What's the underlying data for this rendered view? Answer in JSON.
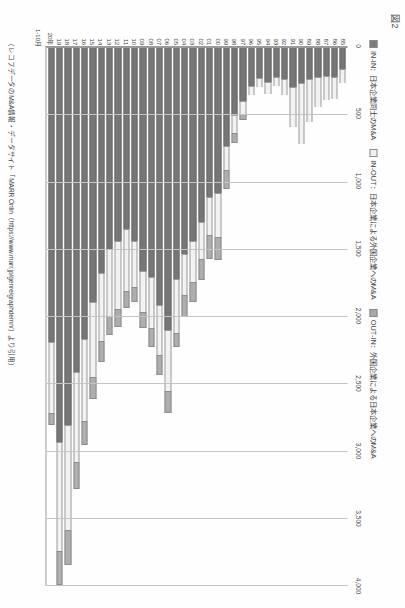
{
  "figure": {
    "label": "図2"
  },
  "legend": {
    "items": [
      {
        "key": "inin",
        "swatch": "dark-gray",
        "color": "#767676",
        "label": "IN-IN：日本企業同士のM&A"
      },
      {
        "key": "inout",
        "swatch": "white",
        "color": "#f2f2f2",
        "label": "IN-OUT：日本企業による外国企業へのM&A"
      },
      {
        "key": "outin",
        "swatch": "medium-gray",
        "color": "#aeaeae",
        "label": "OUT-IN：外国企業による日本企業へのM&A"
      }
    ]
  },
  "source": {
    "text": "（レコフデータのM&A情報・データサイト「MARR Onlin（https://www.marr.jp/genre/graphdemn/）より引用）"
  },
  "axis_note": {
    "last_period": "1-10月",
    "unit": "年"
  },
  "chart_data": {
    "type": "bar",
    "orientation": "horizontal",
    "stacked": true,
    "title": "図2",
    "xlabel": "",
    "ylabel": "年",
    "xlim": [
      0,
      4000
    ],
    "xticks": [
      0,
      500,
      1000,
      1500,
      2000,
      2500,
      3000,
      3500,
      4000
    ],
    "xticklabels": [
      "0",
      "500",
      "1,000",
      "1,500",
      "2,000",
      "2,500",
      "3,000",
      "3,500",
      "4,000"
    ],
    "grid": "vertical",
    "legend_position": "top",
    "categories": [
      "85",
      "86",
      "87",
      "88",
      "89",
      "90",
      "91",
      "92",
      "93",
      "94",
      "95",
      "96",
      "97",
      "98",
      "99",
      "00",
      "01",
      "02",
      "03",
      "04",
      "05",
      "06",
      "07",
      "08",
      "09",
      "10",
      "11",
      "12",
      "13",
      "14",
      "15",
      "16",
      "17",
      "18",
      "19",
      "20年"
    ],
    "series": [
      {
        "name": "IN-IN",
        "color": "#767676",
        "values": [
          163,
          226,
          219,
          223,
          240,
          268,
          298,
          235,
          220,
          258,
          232,
          290,
          398,
          509,
          735,
          1088,
          1117,
          1300,
          1444,
          1536,
          1725,
          2103,
          1920,
          1712,
          1663,
          1441,
          1356,
          1443,
          1501,
          1680,
          1893,
          2174,
          2417,
          2814,
          3000,
          2193
        ]
      },
      {
        "name": "IN-OUT",
        "color": "#f2f2f2",
        "values": [
          107,
          160,
          172,
          224,
          315,
          454,
          297,
          120,
          70,
          89,
          64,
          64,
          97,
          133,
          181,
          325,
          283,
          278,
          305,
          309,
          402,
          455,
          367,
          378,
          310,
          341,
          455,
          508,
          498,
          508,
          558,
          609,
          672,
          777,
          826,
          526
        ]
      },
      {
        "name": "OUT-IN",
        "color": "#aeaeae",
        "values": [
          0,
          0,
          0,
          0,
          0,
          0,
          0,
          0,
          0,
          0,
          0,
          0,
          49,
          70,
          139,
          172,
          173,
          155,
          150,
          165,
          107,
          166,
          150,
          142,
          114,
          113,
          128,
          132,
          146,
          156,
          163,
          174,
          196,
          261,
          260,
          93
        ]
      }
    ]
  }
}
